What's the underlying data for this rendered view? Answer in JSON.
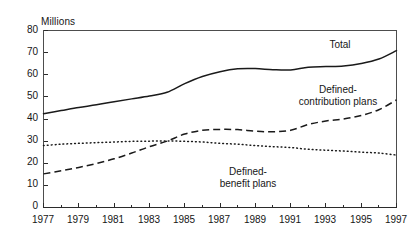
{
  "chart_data": {
    "type": "line",
    "title": "",
    "xlabel": "",
    "ylabel": "Millions",
    "ylabel_position": "top-left",
    "xlim": [
      1977,
      1997
    ],
    "ylim": [
      0,
      80
    ],
    "ytick_step": 10,
    "xtick_step": 2,
    "xminor_tick_step": 1,
    "grid": false,
    "legend": "inline-annotations",
    "yticks": [
      "0",
      "10",
      "20",
      "30",
      "40",
      "50",
      "60",
      "70",
      "80"
    ],
    "xticks": [
      "1977",
      "1979",
      "1981",
      "1983",
      "1985",
      "1987",
      "1989",
      "1991",
      "1993",
      "1995",
      "1997"
    ],
    "x": [
      1977,
      1978,
      1979,
      1980,
      1981,
      1982,
      1983,
      1984,
      1985,
      1986,
      1987,
      1988,
      1989,
      1990,
      1991,
      1992,
      1993,
      1994,
      1995,
      1996,
      1997
    ],
    "series": [
      {
        "name": "Total",
        "style": "solid",
        "color": "#1a1a1a",
        "label": "Total",
        "values": [
          42.4,
          43.8,
          45.2,
          46.4,
          47.8,
          49.1,
          50.4,
          52.1,
          56.0,
          59.2,
          61.4,
          62.7,
          62.8,
          62.3,
          62.2,
          63.4,
          63.7,
          64.0,
          65.1,
          67.1,
          70.9
        ]
      },
      {
        "name": "Defined-contribution plans",
        "style": "dashed",
        "color": "#1a1a1a",
        "label": "Defined-\ncontribution plans",
        "label_line1": "Defined-",
        "label_line2": "contribution plans",
        "values": [
          15.2,
          16.6,
          18.1,
          19.9,
          22.0,
          24.6,
          27.5,
          30.0,
          33.2,
          34.9,
          35.3,
          35.2,
          34.5,
          34.2,
          34.9,
          37.5,
          39.1,
          40.0,
          41.6,
          44.2,
          48.6
        ]
      },
      {
        "name": "Defined-benefit plans",
        "style": "dotted",
        "color": "#1a1a1a",
        "label": "Defined-\nbenefit plans",
        "label_line1": "Defined-",
        "label_line2": "benefit plans",
        "values": [
          28.0,
          28.6,
          29.0,
          29.3,
          29.6,
          29.9,
          30.0,
          30.1,
          29.9,
          29.6,
          29.0,
          28.6,
          28.0,
          27.5,
          27.1,
          26.3,
          25.9,
          25.5,
          25.0,
          24.6,
          23.7
        ]
      }
    ]
  }
}
